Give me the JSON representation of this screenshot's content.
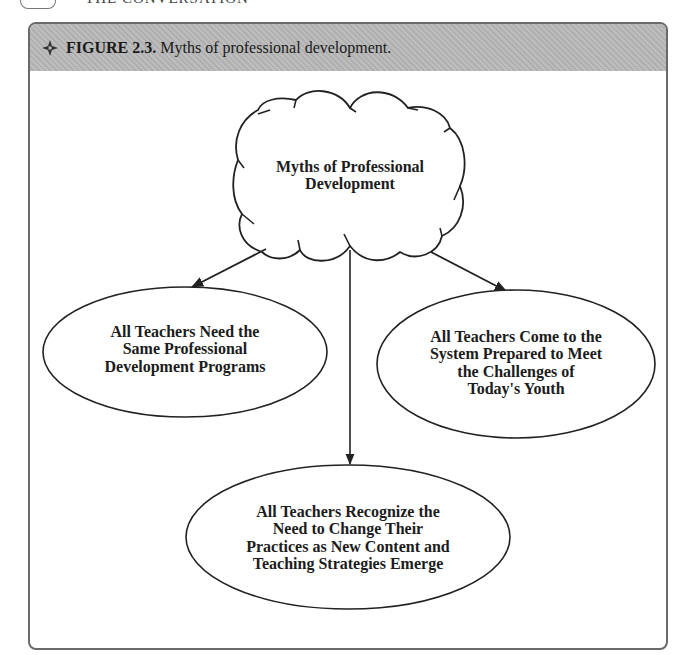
{
  "page_header": {
    "partial_text": "THE CONVERSATION"
  },
  "figure": {
    "number_label": "FIGURE 2.3.",
    "caption": "Myths of professional development.",
    "icon": "compass-diamond-icon",
    "header_color": "#b9b9b9",
    "border_color": "#6a6a6a"
  },
  "diagram": {
    "center": {
      "shape": "cloud",
      "label": "Myths of Professional\nDevelopment"
    },
    "nodes": [
      {
        "id": "same-programs",
        "shape": "ellipse",
        "label": "All Teachers Need the\nSame Professional\nDevelopment Programs"
      },
      {
        "id": "prepared",
        "shape": "ellipse",
        "label": "All Teachers Come to the\nSystem Prepared to Meet\nthe Challenges of\nToday's Youth"
      },
      {
        "id": "recognize-need",
        "shape": "ellipse",
        "label": "All Teachers Recognize the\nNeed to Change Their\nPractices as New Content and\nTeaching Strategies Emerge"
      }
    ],
    "edges": [
      {
        "from": "center",
        "to": "same-programs"
      },
      {
        "from": "center",
        "to": "recognize-need"
      },
      {
        "from": "center",
        "to": "prepared"
      }
    ]
  }
}
